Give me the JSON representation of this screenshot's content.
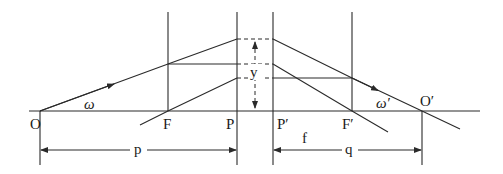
{
  "diagram": {
    "labels": {
      "object_point": "O",
      "front_focal_point": "F",
      "front_principal_point": "P",
      "rear_principal_point": "P′",
      "rear_focal_point": "F′",
      "image_point": "O′",
      "field_angle_object": "ω",
      "field_angle_image": "ω′",
      "height": "y",
      "focal_length": "f",
      "object_distance": "p",
      "image_distance": "q"
    },
    "colors": {
      "line": "#2a2a2a",
      "text": "#1a1a1a",
      "background": "#ffffff"
    }
  }
}
